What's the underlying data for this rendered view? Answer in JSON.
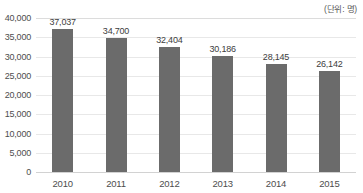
{
  "unit_caption": "(단위: 명)",
  "chart_data": {
    "type": "bar",
    "title": "",
    "subtitle": "",
    "xlabel": "",
    "ylabel": "",
    "unit_note": "(단위: 명)",
    "categories": [
      "2010",
      "2011",
      "2012",
      "2013",
      "2014",
      "2015"
    ],
    "values": [
      37037,
      34700,
      32404,
      30186,
      28145,
      26142
    ],
    "data_labels": [
      "37,037",
      "34,700",
      "32,404",
      "30,186",
      "28,145",
      "26,142"
    ],
    "ylim": [
      0,
      40000
    ],
    "ytick_values": [
      40000,
      35000,
      30000,
      25000,
      20000,
      15000,
      10000,
      5000,
      0
    ],
    "ytick_labels": [
      "40,000",
      "35,000",
      "30,000",
      "25,000",
      "20,000",
      "15,000",
      "10,000",
      "5,000",
      "0"
    ],
    "grid": true,
    "legend": false,
    "legend_position": "none",
    "series": [
      {
        "name": "",
        "values": [
          37037,
          34700,
          32404,
          30186,
          28145,
          26142
        ],
        "color": "#6b6b6b"
      }
    ],
    "colors": {
      "bar": "#6b6b6b",
      "gridline": "#e8e8e8",
      "axis": "#d2d2d2",
      "label_text": "#3d3d3d",
      "tick_text": "#4d4d4d",
      "background": "#ffffff"
    }
  }
}
